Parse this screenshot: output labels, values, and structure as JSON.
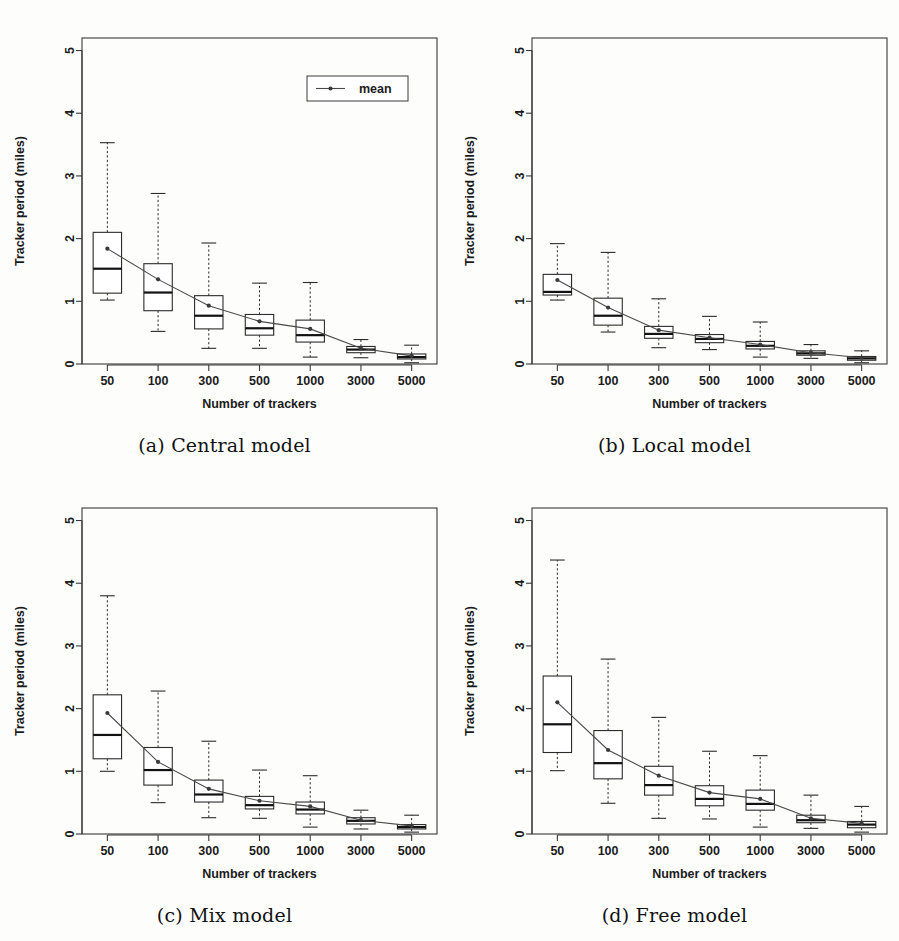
{
  "figure": {
    "panel_count": 4,
    "legend_label": "mean",
    "axis": {
      "xlabel": "Number of trackers",
      "ylabel": "Tracker period (miles)",
      "ytick_labels": [
        "0",
        "1",
        "2",
        "3",
        "4",
        "5"
      ],
      "xtick_labels": [
        "50",
        "100",
        "300",
        "500",
        "1000",
        "3000",
        "5000"
      ]
    },
    "captions": {
      "a": "(a) Central model",
      "b": "(b) Local model",
      "c": "(c) Mix model",
      "d": "(d) Free model"
    }
  },
  "chart_data": [
    {
      "id": "a",
      "type": "boxplot",
      "title": "(a) Central model",
      "xlabel": "Number of trackers",
      "ylabel": "Tracker period (miles)",
      "ylim": [
        0,
        5.2
      ],
      "ytick_labels": [
        "0",
        "1",
        "2",
        "3",
        "4",
        "5"
      ],
      "yticks": [
        0,
        1,
        2,
        3,
        4,
        5
      ],
      "categories": [
        "50",
        "100",
        "300",
        "500",
        "1000",
        "3000",
        "5000"
      ],
      "grid": false,
      "legend": {
        "position": "top-right",
        "entries": [
          "mean"
        ]
      },
      "boxes": [
        {
          "category": "50",
          "whisker_low": 1.02,
          "q1": 1.13,
          "median": 1.52,
          "q3": 2.1,
          "whisker_high": 3.53,
          "mean": 1.84
        },
        {
          "category": "100",
          "whisker_low": 0.52,
          "q1": 0.85,
          "median": 1.14,
          "q3": 1.6,
          "whisker_high": 2.72,
          "mean": 1.35
        },
        {
          "category": "300",
          "whisker_low": 0.25,
          "q1": 0.56,
          "median": 0.77,
          "q3": 1.09,
          "whisker_high": 1.93,
          "mean": 0.93
        },
        {
          "category": "500",
          "whisker_low": 0.25,
          "q1": 0.46,
          "median": 0.57,
          "q3": 0.79,
          "whisker_high": 1.29,
          "mean": 0.68
        },
        {
          "category": "1000",
          "whisker_low": 0.11,
          "q1": 0.35,
          "median": 0.46,
          "q3": 0.7,
          "whisker_high": 1.3,
          "mean": 0.56
        },
        {
          "category": "3000",
          "whisker_low": 0.1,
          "q1": 0.18,
          "median": 0.23,
          "q3": 0.28,
          "whisker_high": 0.39,
          "mean": 0.25
        },
        {
          "category": "5000",
          "whisker_low": 0.02,
          "q1": 0.08,
          "median": 0.11,
          "q3": 0.16,
          "whisker_high": 0.3,
          "mean": 0.13
        }
      ],
      "mean_series": {
        "name": "mean",
        "values": [
          1.84,
          1.35,
          0.93,
          0.68,
          0.56,
          0.25,
          0.13
        ]
      }
    },
    {
      "id": "b",
      "type": "boxplot",
      "title": "(b) Local model",
      "xlabel": "Number of trackers",
      "ylabel": "Tracker period (miles)",
      "ylim": [
        0,
        5.2
      ],
      "ytick_labels": [
        "0",
        "1",
        "2",
        "3",
        "4",
        "5"
      ],
      "yticks": [
        0,
        1,
        2,
        3,
        4,
        5
      ],
      "categories": [
        "50",
        "100",
        "300",
        "500",
        "1000",
        "3000",
        "5000"
      ],
      "grid": false,
      "legend": null,
      "boxes": [
        {
          "category": "50",
          "whisker_low": 1.02,
          "q1": 1.1,
          "median": 1.15,
          "q3": 1.43,
          "whisker_high": 1.92,
          "mean": 1.34
        },
        {
          "category": "100",
          "whisker_low": 0.51,
          "q1": 0.62,
          "median": 0.77,
          "q3": 1.05,
          "whisker_high": 1.78,
          "mean": 0.9
        },
        {
          "category": "300",
          "whisker_low": 0.26,
          "q1": 0.41,
          "median": 0.48,
          "q3": 0.6,
          "whisker_high": 1.04,
          "mean": 0.54
        },
        {
          "category": "500",
          "whisker_low": 0.23,
          "q1": 0.34,
          "median": 0.4,
          "q3": 0.47,
          "whisker_high": 0.76,
          "mean": 0.42
        },
        {
          "category": "1000",
          "whisker_low": 0.11,
          "q1": 0.24,
          "median": 0.29,
          "q3": 0.36,
          "whisker_high": 0.67,
          "mean": 0.31
        },
        {
          "category": "3000",
          "whisker_low": 0.09,
          "q1": 0.14,
          "median": 0.17,
          "q3": 0.21,
          "whisker_high": 0.31,
          "mean": 0.18
        },
        {
          "category": "5000",
          "whisker_low": 0.02,
          "q1": 0.06,
          "median": 0.09,
          "q3": 0.12,
          "whisker_high": 0.21,
          "mean": 0.1
        }
      ],
      "mean_series": {
        "name": "mean",
        "values": [
          1.34,
          0.9,
          0.54,
          0.42,
          0.31,
          0.18,
          0.1
        ]
      }
    },
    {
      "id": "c",
      "type": "boxplot",
      "title": "(c) Mix model",
      "xlabel": "Number of trackers",
      "ylabel": "Tracker period (miles)",
      "ylim": [
        0,
        5.2
      ],
      "ytick_labels": [
        "0",
        "1",
        "2",
        "3",
        "4",
        "5"
      ],
      "yticks": [
        0,
        1,
        2,
        3,
        4,
        5
      ],
      "categories": [
        "50",
        "100",
        "300",
        "500",
        "1000",
        "3000",
        "5000"
      ],
      "grid": false,
      "legend": null,
      "boxes": [
        {
          "category": "50",
          "whisker_low": 1.0,
          "q1": 1.2,
          "median": 1.58,
          "q3": 2.22,
          "whisker_high": 3.8,
          "mean": 1.93
        },
        {
          "category": "100",
          "whisker_low": 0.5,
          "q1": 0.78,
          "median": 1.02,
          "q3": 1.38,
          "whisker_high": 2.28,
          "mean": 1.15
        },
        {
          "category": "300",
          "whisker_low": 0.26,
          "q1": 0.51,
          "median": 0.63,
          "q3": 0.86,
          "whisker_high": 1.48,
          "mean": 0.72
        },
        {
          "category": "500",
          "whisker_low": 0.25,
          "q1": 0.4,
          "median": 0.46,
          "q3": 0.6,
          "whisker_high": 1.02,
          "mean": 0.53
        },
        {
          "category": "1000",
          "whisker_low": 0.11,
          "q1": 0.32,
          "median": 0.39,
          "q3": 0.51,
          "whisker_high": 0.93,
          "mean": 0.44
        },
        {
          "category": "3000",
          "whisker_low": 0.08,
          "q1": 0.16,
          "median": 0.21,
          "q3": 0.26,
          "whisker_high": 0.38,
          "mean": 0.22
        },
        {
          "category": "5000",
          "whisker_low": 0.03,
          "q1": 0.08,
          "median": 0.11,
          "q3": 0.15,
          "whisker_high": 0.3,
          "mean": 0.13
        }
      ],
      "mean_series": {
        "name": "mean",
        "values": [
          1.93,
          1.15,
          0.72,
          0.53,
          0.44,
          0.22,
          0.13
        ]
      }
    },
    {
      "id": "d",
      "type": "boxplot",
      "title": "(d) Free model",
      "xlabel": "Number of trackers",
      "ylabel": "Tracker period (miles)",
      "ylim": [
        0,
        5.2
      ],
      "ytick_labels": [
        "0",
        "1",
        "2",
        "3",
        "4",
        "5"
      ],
      "yticks": [
        0,
        1,
        2,
        3,
        4,
        5
      ],
      "categories": [
        "50",
        "100",
        "300",
        "500",
        "1000",
        "3000",
        "5000"
      ],
      "grid": false,
      "legend": null,
      "boxes": [
        {
          "category": "50",
          "whisker_low": 1.01,
          "q1": 1.3,
          "median": 1.75,
          "q3": 2.52,
          "whisker_high": 4.37,
          "mean": 2.1
        },
        {
          "category": "100",
          "whisker_low": 0.49,
          "q1": 0.88,
          "median": 1.13,
          "q3": 1.65,
          "whisker_high": 2.79,
          "mean": 1.34
        },
        {
          "category": "300",
          "whisker_low": 0.25,
          "q1": 0.62,
          "median": 0.78,
          "q3": 1.08,
          "whisker_high": 1.86,
          "mean": 0.93
        },
        {
          "category": "500",
          "whisker_low": 0.24,
          "q1": 0.45,
          "median": 0.56,
          "q3": 0.77,
          "whisker_high": 1.32,
          "mean": 0.66
        },
        {
          "category": "1000",
          "whisker_low": 0.11,
          "q1": 0.38,
          "median": 0.48,
          "q3": 0.7,
          "whisker_high": 1.25,
          "mean": 0.56
        },
        {
          "category": "3000",
          "whisker_low": 0.09,
          "q1": 0.18,
          "median": 0.22,
          "q3": 0.3,
          "whisker_high": 0.62,
          "mean": 0.25
        },
        {
          "category": "5000",
          "whisker_low": 0.03,
          "q1": 0.1,
          "median": 0.15,
          "q3": 0.2,
          "whisker_high": 0.44,
          "mean": 0.17
        }
      ],
      "mean_series": {
        "name": "mean",
        "values": [
          2.1,
          1.34,
          0.93,
          0.66,
          0.56,
          0.25,
          0.17
        ]
      }
    }
  ]
}
